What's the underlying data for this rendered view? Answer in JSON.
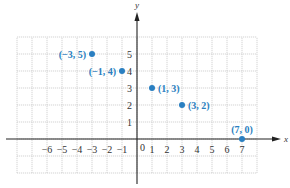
{
  "chart_data": {
    "type": "scatter",
    "title": "",
    "xlabel": "x",
    "ylabel": "y",
    "xlim": [
      -8,
      8
    ],
    "ylim": [
      -2,
      6
    ],
    "grid": true,
    "x_ticks": [
      -6,
      -5,
      -4,
      -3,
      -2,
      -1,
      1,
      2,
      3,
      4,
      5,
      6,
      7
    ],
    "y_ticks": [
      1,
      2,
      3,
      4,
      5
    ],
    "origin_label": "0",
    "points": [
      {
        "x": -3,
        "y": 5,
        "label": "(−3, 5)",
        "label_pos": "left"
      },
      {
        "x": -1,
        "y": 4,
        "label": "(−1, 4)",
        "label_pos": "left"
      },
      {
        "x": 1,
        "y": 3,
        "label": "(1, 3)",
        "label_pos": "right"
      },
      {
        "x": 3,
        "y": 2,
        "label": "(3, 2)",
        "label_pos": "right"
      },
      {
        "x": 7,
        "y": 0,
        "label": "(7, 0)",
        "label_pos": "above"
      }
    ],
    "colors": {
      "point": "#2a7fc1",
      "grid": "#c8c8c8",
      "axis": "#222222"
    }
  }
}
